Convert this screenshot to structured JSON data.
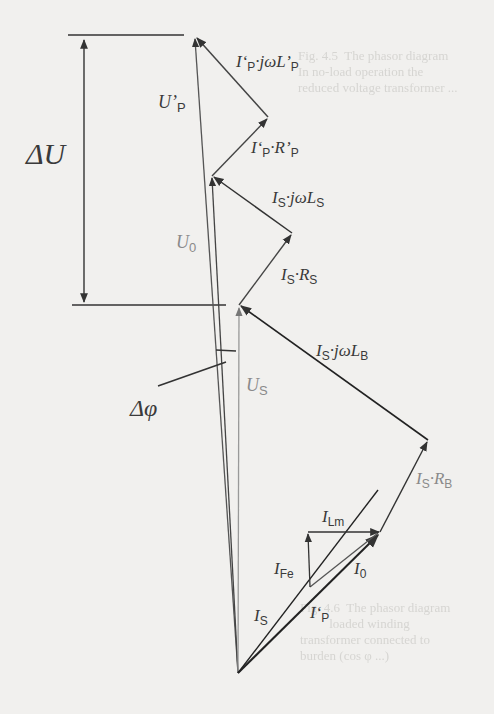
{
  "diagram": {
    "labels": {
      "delta_u": "ΔU",
      "delta_phi": "Δφ",
      "u_p_prime": {
        "main": "U’",
        "sub": "P"
      },
      "u_0": {
        "main": "U",
        "sub": "0"
      },
      "u_s": {
        "main": "U",
        "sub": "S"
      },
      "ip_jwlp": {
        "a": "I‘",
        "sa": "P",
        "b": "·jωL’",
        "sb": "P"
      },
      "ip_rp": {
        "a": "I‘",
        "sa": "P",
        "b": "·R’",
        "sb": "P"
      },
      "is_jwls": {
        "a": "I",
        "sa": "S",
        "b": "·jωL",
        "sb": "S"
      },
      "is_rs": {
        "a": "I",
        "sa": "S",
        "b": "·R",
        "sb": "S"
      },
      "is_jwlb": {
        "a": "I",
        "sa": "S",
        "b": "·jωL",
        "sb": "B"
      },
      "is_rb": {
        "a": "I",
        "sa": "S",
        "b": "·R",
        "sb": "B"
      },
      "i_lm": {
        "main": "I",
        "sub": "Lm"
      },
      "i_fe": {
        "main": "I",
        "sub": "Fe"
      },
      "i_0": {
        "main": "I",
        "sub": "0"
      },
      "i_s": {
        "main": "I",
        "sub": "S"
      },
      "i_p_prime": {
        "main": "I‘",
        "sub": "P"
      }
    },
    "vectors": [
      {
        "name": "U'_P",
        "from": [
          238,
          673
        ],
        "to": [
          195,
          37
        ]
      },
      {
        "name": "U_0",
        "from": [
          238,
          673
        ],
        "to": [
          212,
          176
        ]
      },
      {
        "name": "U_S",
        "from": [
          238,
          673
        ],
        "to": [
          239,
          305
        ]
      },
      {
        "name": "I_S·jωL_B",
        "from": [
          428,
          440
        ],
        "to": [
          239,
          305
        ]
      },
      {
        "name": "I_S·R_B",
        "from": [
          380,
          532
        ],
        "to": [
          428,
          440
        ]
      },
      {
        "name": "I_S·R_S",
        "from": [
          239,
          305
        ],
        "to": [
          292,
          233
        ]
      },
      {
        "name": "I_S·jωL_S",
        "from": [
          292,
          233
        ],
        "to": [
          212,
          176
        ]
      },
      {
        "name": "I'_P·R'_P",
        "from": [
          212,
          176
        ],
        "to": [
          268,
          117
        ]
      },
      {
        "name": "I'_P·jωL'_P",
        "from": [
          268,
          117
        ],
        "to": [
          195,
          37
        ]
      },
      {
        "name": "I_Lm",
        "from": [
          308,
          532
        ],
        "to": [
          380,
          532
        ]
      },
      {
        "name": "I_Fe",
        "from": [
          310,
          587
        ],
        "to": [
          308,
          532
        ]
      },
      {
        "name": "I_0",
        "from": [
          238,
          673
        ],
        "to": [
          380,
          532
        ]
      }
    ]
  },
  "background_bleed": {
    "top_right": "Fig. 4.5  The phasor diagram\nIn no-load operation the\nreduced voltage transformer ...",
    "bottom_right": "Fig. 4.6  The phasor diagram\n         loaded winding\ntransformer connected to\nburden (cos φ ...)"
  }
}
